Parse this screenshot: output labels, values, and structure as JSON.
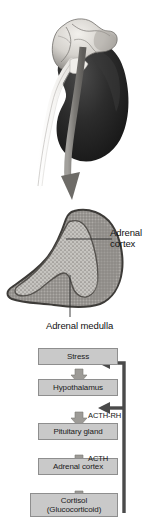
{
  "figure": {
    "panels": {
      "kidney": {
        "name": "kidney-with-adrenal-gland",
        "parts": {
          "adrenal_gland": "adrenal gland",
          "kidney": "kidney",
          "ureter": "ureter",
          "pointer_arrow": "magnification arrow"
        }
      },
      "cross_section": {
        "name": "adrenal-gland-cross-section",
        "labels": {
          "cortex_line1": "Adrenal",
          "cortex_line2": "cortex",
          "medulla": "Adrenal medulla"
        }
      },
      "flowchart": {
        "name": "hpa-axis-flowchart",
        "boxes": [
          {
            "id": "stress",
            "lines": [
              "Stress"
            ]
          },
          {
            "id": "hypothalamus",
            "lines": [
              "Hypothalamus"
            ]
          },
          {
            "id": "pituitary",
            "lines": [
              "Pituitary gland"
            ]
          },
          {
            "id": "adrenal_cortex",
            "lines": [
              "Adrenal cortex"
            ]
          },
          {
            "id": "cortisol",
            "lines": [
              "Cortisol",
              "(Glucocorticoid)"
            ]
          }
        ],
        "arrow_labels": [
          {
            "id": "acth_rh",
            "text": "ACTH-RH"
          },
          {
            "id": "acth",
            "text": "ACTH"
          }
        ]
      }
    },
    "colors": {
      "box_fill": "#c9c9c9",
      "box_border": "#8e8e8e",
      "arrow_gray": "#8b8b8b",
      "feedback_dark": "#4a4a4a",
      "kidney_dark": "#262626",
      "gland_light": "#d8d6d2",
      "cortex_gray": "#8a8a8a",
      "medulla_gray": "#b8b6b2",
      "text": "#1a1a1a"
    }
  }
}
